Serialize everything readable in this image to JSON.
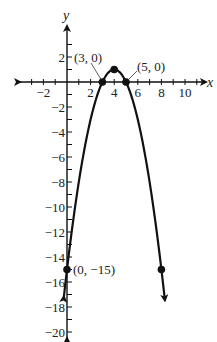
{
  "chart_data": {
    "type": "line",
    "title": "",
    "function": "y = -x^2 + 8x - 15",
    "xlabel": "x",
    "ylabel": "y",
    "xlim": [
      -3,
      11
    ],
    "ylim": [
      -21,
      3
    ],
    "grid": false,
    "x_ticks": [
      -2,
      2,
      4,
      6,
      8,
      10
    ],
    "x_tick_labels": [
      "−2",
      "2",
      "4",
      "6",
      "8",
      "10"
    ],
    "y_ticks": [
      2,
      -2,
      -4,
      -6,
      -8,
      -10,
      -12,
      -14,
      -16,
      -18,
      -20
    ],
    "y_tick_labels": [
      "2",
      "−2",
      "−4",
      "−6",
      "−8",
      "−10",
      "−12",
      "−14",
      "−16",
      "−18",
      "−20"
    ],
    "series": [
      {
        "name": "parabola",
        "x": [
          -0.3,
          0,
          1,
          2,
          3,
          4,
          5,
          6,
          7,
          8,
          8.3
        ],
        "values": [
          -17.5,
          -15,
          -8,
          -3,
          0,
          1,
          0,
          -3,
          -8,
          -15,
          -17.5
        ]
      }
    ],
    "points": [
      {
        "x": 3,
        "y": 0,
        "label": "(3, 0)"
      },
      {
        "x": 4,
        "y": 1,
        "label": ""
      },
      {
        "x": 5,
        "y": 0,
        "label": "(5, 0)"
      },
      {
        "x": 0,
        "y": -15,
        "label": "(0, −15)"
      },
      {
        "x": 8,
        "y": -15,
        "label": ""
      }
    ],
    "annotations": [
      "(3, 0)",
      "(5, 0)",
      "(0, −15)"
    ]
  }
}
